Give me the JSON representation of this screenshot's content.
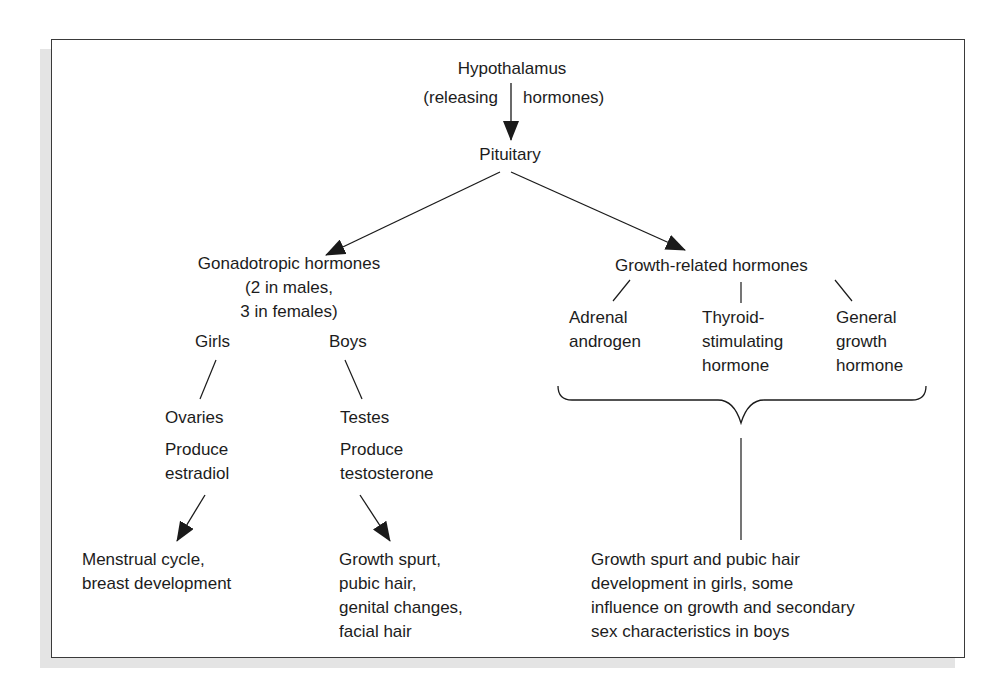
{
  "diagram": {
    "top": {
      "hypothalamus": "Hypothalamus",
      "releasing_left": "(releasing",
      "releasing_right": "hormones)",
      "pituitary": "Pituitary"
    },
    "gonadotropic": {
      "title_lines": [
        "Gonadotropic hormones",
        "(2 in males,",
        "3 in females)"
      ],
      "girls": {
        "label": "Girls",
        "organ": "Ovaries",
        "produce_lines": [
          "Produce",
          "estradiol"
        ],
        "effects_lines": [
          "Menstrual cycle,",
          "breast development"
        ]
      },
      "boys": {
        "label": "Boys",
        "organ": "Testes",
        "produce_lines": [
          "Produce",
          "testosterone"
        ],
        "effects_lines": [
          "Growth spurt,",
          "pubic hair,",
          "genital changes,",
          "facial hair"
        ]
      }
    },
    "growth_related": {
      "title": "Growth-related hormones",
      "hormones": [
        {
          "lines": [
            "Adrenal",
            "androgen"
          ]
        },
        {
          "lines": [
            "Thyroid-",
            "stimulating",
            "hormone"
          ]
        },
        {
          "lines": [
            "General",
            "growth",
            "hormone"
          ]
        }
      ],
      "effects_lines": [
        "Growth spurt and pubic hair",
        "development in girls, some",
        "influence on growth and secondary",
        "sex characteristics in boys"
      ]
    },
    "colors": {
      "line": "#1a1a1a",
      "frame": "#3a3a3a",
      "shadow": "#e4e4e4"
    }
  }
}
